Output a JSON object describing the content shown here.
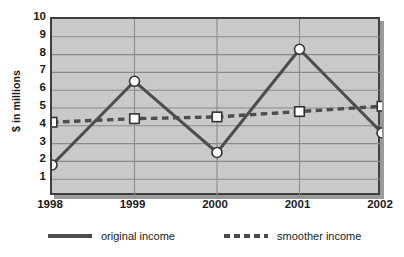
{
  "chart_data": {
    "type": "line",
    "title": "",
    "xlabel": "",
    "ylabel": "$ in millions",
    "categories": [
      "1998",
      "1999",
      "2000",
      "2001",
      "2002"
    ],
    "ylim": [
      0,
      10
    ],
    "yticks": [
      1,
      2,
      3,
      4,
      5,
      6,
      7,
      8,
      9,
      10
    ],
    "ytick_labels": [
      "1",
      "2",
      "3",
      "4",
      "5",
      "6",
      "7",
      "8",
      "9",
      "10"
    ],
    "grid": "horizontal-and-vertical",
    "legend_position": "bottom",
    "series": [
      {
        "name": "original income",
        "style": "solid",
        "marker": "circle",
        "color": "#4d4d4d",
        "values": [
          1.8,
          6.5,
          2.5,
          8.3,
          3.6
        ]
      },
      {
        "name": "smoother income",
        "style": "dashed",
        "marker": "square",
        "color": "#4d4d4d",
        "values": [
          4.2,
          4.4,
          4.5,
          4.8,
          5.1
        ]
      }
    ]
  },
  "axes": {
    "y_title": "$ in millions",
    "y_labels": [
      "10",
      "9",
      "8",
      "7",
      "6",
      "5",
      "4",
      "3",
      "2",
      "1"
    ],
    "x_labels": [
      "1998",
      "1999",
      "2000",
      "2001",
      "2002"
    ]
  },
  "legend": {
    "items": [
      {
        "label": "original income",
        "style": "solid"
      },
      {
        "label": "smoother income",
        "style": "dashed"
      }
    ]
  },
  "colors": {
    "plot_background": "#c9c9c9",
    "frame": "#404040",
    "gridline": "#8a8a8a",
    "series_line": "#4d4d4d",
    "marker_fill": "#ffffff",
    "text": "#1a1a1a",
    "shadow": "#9a9a9a"
  }
}
